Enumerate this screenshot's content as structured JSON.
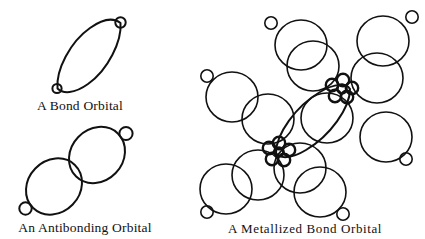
{
  "figure": {
    "background_color": "#ffffff",
    "ink_color": "#111111",
    "panels": [
      {
        "id": "bond-orbital",
        "caption": "A Bond Orbital",
        "caption_x": 80,
        "caption_y": 110,
        "description": "lens-shaped bond orbital with small circle at each tip",
        "axis_angle_deg": -46,
        "lens": {
          "cx": 88,
          "cy": 56,
          "rx": 47,
          "ry": 14
        },
        "tips": [
          {
            "cx": 57,
            "cy": 88,
            "r": 4.5
          },
          {
            "cx": 120,
            "cy": 23,
            "r": 5.0
          }
        ]
      },
      {
        "id": "antibonding-orbital",
        "caption": "An Antibonding Orbital",
        "caption_x": 85,
        "caption_y": 232,
        "description": "two tangent lobes along a diagonal, small circle at each outer end",
        "axis_angle_deg": -46,
        "lobes": [
          {
            "cx": 54,
            "cy": 186,
            "rx": 30,
            "ry": 26
          },
          {
            "cx": 97,
            "cy": 155,
            "rx": 30,
            "ry": 26
          }
        ],
        "tips": [
          {
            "cx": 26,
            "cy": 208,
            "r": 6.0
          },
          {
            "cx": 126,
            "cy": 134,
            "r": 6.5
          }
        ]
      },
      {
        "id": "metallized-bond-orbital",
        "caption": "A Metallized Bond Orbital",
        "caption_x": 305,
        "caption_y": 232,
        "description": "bond orbital lens joining two rosette metal nodes, each node surrounded by large circles that carry small satellite circles",
        "lens": {
          "cx": 311,
          "cy": 128,
          "rx": 58,
          "ry": 14,
          "angle_deg": -44
        },
        "nodes": [
          {
            "id": "node-upper-right",
            "cx": 340,
            "cy": 88
          },
          {
            "id": "node-lower-left",
            "cx": 278,
            "cy": 152
          }
        ],
        "node_rosette": {
          "petal_count": 5,
          "petal_r": 6.5,
          "petal_orbit": 7.0,
          "center_r": 5.0
        },
        "big_circles": [
          {
            "cx": 299,
            "cy": 45,
            "r": 25
          },
          {
            "cx": 381,
            "cy": 40,
            "r": 25
          },
          {
            "cx": 231,
            "cy": 96,
            "r": 25
          },
          {
            "cx": 385,
            "cy": 135,
            "r": 25
          },
          {
            "cx": 225,
            "cy": 188,
            "r": 25
          },
          {
            "cx": 318,
            "cy": 193,
            "r": 25
          },
          {
            "cx": 330,
            "cy": 122,
            "r": 25
          },
          {
            "cx": 385,
            "cy": 75,
            "r": 25
          },
          {
            "cx": 272,
            "cy": 113,
            "r": 25
          },
          {
            "cx": 262,
            "cy": 172,
            "r": 25
          },
          {
            "cx": 296,
            "cy": 162,
            "r": 25
          }
        ],
        "satellites": [
          {
            "cx": 269,
            "cy": 23,
            "r": 6.0
          },
          {
            "cx": 410,
            "cy": 17,
            "r": 6.0
          },
          {
            "cx": 207,
            "cy": 76,
            "r": 6.0
          },
          {
            "cx": 404,
            "cy": 157,
            "r": 6.0
          },
          {
            "cx": 208,
            "cy": 212,
            "r": 6.0
          },
          {
            "cx": 341,
            "cy": 214,
            "r": 6.0
          }
        ]
      }
    ]
  }
}
